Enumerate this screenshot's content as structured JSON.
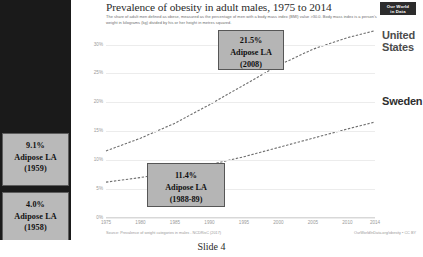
{
  "slide": {
    "caption": "Slide 4",
    "logo": {
      "line1": "Our World",
      "line2": "in Data",
      "name": "our-world-in-data-logo"
    }
  },
  "chart_header": {
    "title": "Prevalence of obesity in adult males, 1975 to 2014",
    "subtitle": "The share of adult men defined as obese, measured as the percentage of men with a body mass index (BMI) value >30.0. Body mass index is a person's weight in kilograms (kg) divided by his or her height in metres squared."
  },
  "footer": {
    "source": "Source: Prevalence of weight categories in males - NCDRisC (2017)",
    "credit": "OurWorldInData.org/obesity • CC BY"
  },
  "annotations": {
    "left_panel": [
      {
        "id": "adipose-1959",
        "value": "9.1%",
        "label": "Adipose LA",
        "year": "(1959)"
      },
      {
        "id": "adipose-1958",
        "value": "4.0%",
        "label": "Adipose LA",
        "year": "(1958)"
      }
    ],
    "plot": [
      {
        "id": "adipose-2008",
        "value": "21.5%",
        "label": "Adipose LA",
        "year": "(2008)"
      },
      {
        "id": "adipose-1988",
        "value": "11.4%",
        "label": "Adipose LA",
        "year": "(1988-89)"
      }
    ]
  },
  "chart_data": {
    "type": "line",
    "title": "Prevalence of obesity in adult males, 1975 to 2014",
    "xlabel": "",
    "ylabel": "",
    "xlim": [
      1975,
      2014
    ],
    "ylim": [
      0,
      32
    ],
    "grid": true,
    "legend_position": "right-end-labels",
    "yticks": [
      "0%",
      "5%",
      "10%",
      "15%",
      "20%",
      "25%",
      "30%"
    ],
    "ytick_values": [
      0,
      5,
      10,
      15,
      20,
      25,
      30
    ],
    "xticks": [
      "1975",
      "1980",
      "1985",
      "1990",
      "1995",
      "2000",
      "2005",
      "2010",
      "2014"
    ],
    "xtick_values": [
      1975,
      1980,
      1985,
      1990,
      1995,
      2000,
      2005,
      2010,
      2014
    ],
    "x": [
      1975,
      1980,
      1985,
      1990,
      1995,
      2000,
      2005,
      2010,
      2014
    ],
    "series": [
      {
        "name": "United States",
        "color": "#6e6e6e",
        "values": [
          11.6,
          13.8,
          16.4,
          19.6,
          23.0,
          26.4,
          29.2,
          31.2,
          32.4
        ]
      },
      {
        "name": "Sweden",
        "color": "#6e6e6e",
        "values": [
          6.2,
          7.0,
          8.0,
          9.2,
          10.6,
          12.2,
          13.8,
          15.4,
          16.6
        ]
      }
    ]
  }
}
